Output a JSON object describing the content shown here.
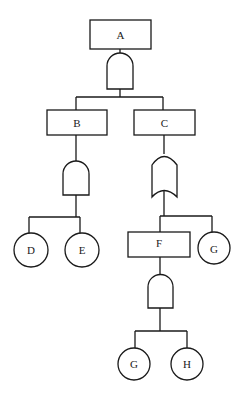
{
  "diagram": {
    "type": "fault-tree",
    "nodes": {
      "A": {
        "label": "A",
        "shape": "event-box"
      },
      "B": {
        "label": "B",
        "shape": "event-box"
      },
      "C": {
        "label": "C",
        "shape": "event-box"
      },
      "F": {
        "label": "F",
        "shape": "event-box"
      },
      "D": {
        "label": "D",
        "shape": "basic-event-circle"
      },
      "E": {
        "label": "E",
        "shape": "basic-event-circle"
      },
      "G1": {
        "label": "G",
        "shape": "basic-event-circle"
      },
      "G2": {
        "label": "G",
        "shape": "basic-event-circle"
      },
      "H": {
        "label": "H",
        "shape": "basic-event-circle"
      }
    },
    "gates": [
      {
        "output": "A",
        "type": "AND",
        "inputs": [
          "B",
          "C"
        ]
      },
      {
        "output": "B",
        "type": "AND",
        "inputs": [
          "D",
          "E"
        ]
      },
      {
        "output": "C",
        "type": "OR",
        "inputs": [
          "F",
          "G1"
        ]
      },
      {
        "output": "F",
        "type": "AND",
        "inputs": [
          "G2",
          "H"
        ]
      }
    ]
  }
}
